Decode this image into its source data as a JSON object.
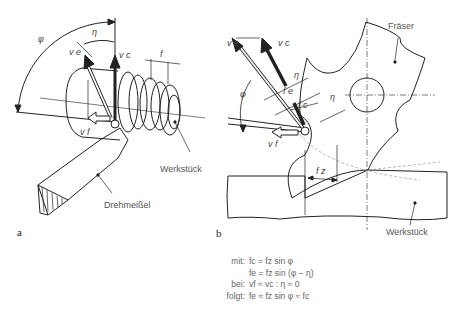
{
  "figure": {
    "panel_a": {
      "label": "a",
      "symbols": {
        "phi": "φ",
        "eta": "η",
        "ve": "v e",
        "vc": "v c",
        "vf": "v f",
        "f": "f"
      },
      "callouts": {
        "workpiece": "Werkstück",
        "tool": "Drehmeißel"
      }
    },
    "panel_b": {
      "label": "b",
      "symbols": {
        "phi": "φ",
        "eta": "η",
        "eta2": "η",
        "ve": "v e",
        "vc": "v c",
        "vf": "v f",
        "fe": "f e",
        "fc": "f c",
        "fz": "f z"
      },
      "callouts": {
        "cutter": "Fräser",
        "workpiece": "Werkstück"
      }
    },
    "formulas": [
      {
        "key": "mit:",
        "value": "fc = fz sin φ"
      },
      {
        "key": "",
        "value": "fe = fz sin (φ − η)"
      },
      {
        "key": "bei:",
        "value": "vf ≈ vc : η ≈ 0"
      },
      {
        "key": "folgt:",
        "value": "fe ≈ fz sin φ ≈ fc"
      }
    ]
  },
  "colors": {
    "line": "#222222",
    "text": "#555555",
    "background": "#ffffff"
  }
}
